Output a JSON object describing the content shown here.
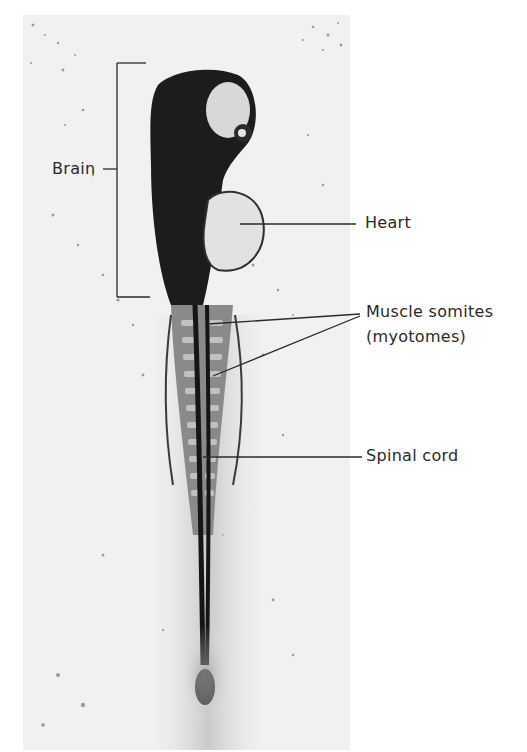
{
  "figure": {
    "background_color": "#f1f1ef",
    "specimen_color": "#1c1c1c",
    "line_color": "#2a2a2a"
  },
  "labels": {
    "brain": "Brain",
    "heart": "Heart",
    "muscle_somites_line1": "Muscle somites",
    "muscle_somites_line2": "(myotomes)",
    "spinal_cord": "Spinal cord"
  }
}
